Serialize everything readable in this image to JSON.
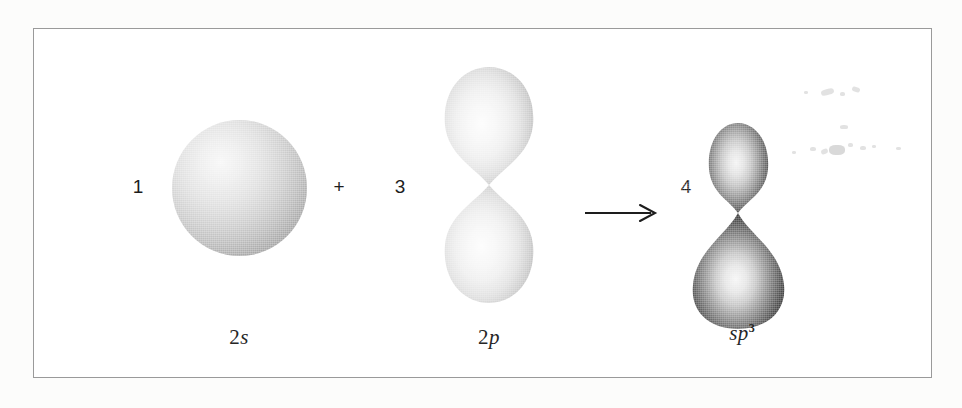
{
  "figure": {
    "name": "sp3-hybridization-diagram",
    "caption_equation": "1 (2s) + 3 (2p) -> 4 (sp3)",
    "border_color": "#9a9a9a",
    "background_color": "#ffffff"
  },
  "equation": {
    "terms": [
      {
        "coefficient": "1",
        "orbital_id": "2s",
        "label_number": "2",
        "label_symbol": "s",
        "label_superscript": "",
        "shape": "sphere"
      },
      {
        "coefficient": "3",
        "orbital_id": "2p",
        "label_number": "2",
        "label_symbol": "p",
        "label_superscript": "",
        "shape": "symmetric-dumbbell"
      },
      {
        "coefficient": "4",
        "orbital_id": "sp3",
        "label_number": "",
        "label_symbol": "sp",
        "label_superscript": "3",
        "shape": "asymmetric-dumbbell"
      }
    ],
    "plus_operator": "+",
    "arrow_operator": "→"
  },
  "colors": {
    "ink": "#1d1d1d",
    "label_ink": "#262626",
    "s_orbital_light": "#f7f7f7",
    "s_orbital_dark": "#888888",
    "p_orbital_light": "#fbfbfb",
    "p_orbital_dark": "#b9b9b9",
    "sp3_orbital_light": "#f2f2f2",
    "sp3_orbital_dark": "#3a3a3a",
    "frame": "#9a9a9a"
  }
}
